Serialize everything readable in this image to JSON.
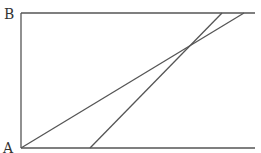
{
  "diagram": {
    "labels": {
      "top_left": "B",
      "bottom_left": "A"
    },
    "stroke_color": "#555555",
    "lines": [
      {
        "name": "left-edge",
        "x1": 21,
        "y1": 13,
        "x2": 21,
        "y2": 148
      },
      {
        "name": "top-edge",
        "x1": 21,
        "y1": 13,
        "x2": 255,
        "y2": 13
      },
      {
        "name": "bottom-edge",
        "x1": 21,
        "y1": 148,
        "x2": 255,
        "y2": 148
      },
      {
        "name": "diagonal-from-A",
        "x1": 21,
        "y1": 148,
        "x2": 244,
        "y2": 13
      },
      {
        "name": "steep-diagonal",
        "x1": 90,
        "y1": 148,
        "x2": 222,
        "y2": 13
      }
    ]
  }
}
